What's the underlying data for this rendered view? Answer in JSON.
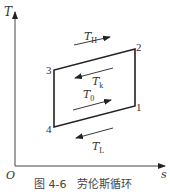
{
  "figure": {
    "caption": "图 4-6　劳伦斯循环",
    "axes": {
      "y_label": "T",
      "x_label": "s",
      "origin_label": "O"
    },
    "points": [
      {
        "id": "1",
        "label": "1",
        "x": 135,
        "y": 106
      },
      {
        "id": "2",
        "label": "2",
        "x": 135,
        "y": 49
      },
      {
        "id": "3",
        "label": "3",
        "x": 54,
        "y": 70
      },
      {
        "id": "4",
        "label": "4",
        "x": 54,
        "y": 127
      }
    ],
    "temperatures": [
      {
        "name": "T_H",
        "main": "T",
        "sub": "H",
        "arrow_direction": "right"
      },
      {
        "name": "T_k",
        "main": "T",
        "sub": "k",
        "arrow_direction": "left"
      },
      {
        "name": "T_0",
        "main": "T",
        "sub": "0",
        "arrow_direction": "right"
      },
      {
        "name": "T_L",
        "main": "T",
        "sub": "L",
        "arrow_direction": "left"
      }
    ],
    "colors": {
      "line": "#222222",
      "text": "#333333"
    }
  }
}
